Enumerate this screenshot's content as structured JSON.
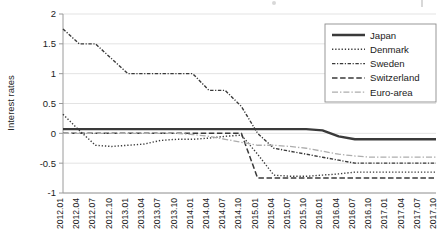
{
  "chart_data": {
    "type": "line",
    "title": "",
    "xlabel": "",
    "ylabel": "Interest rates",
    "ylim": [
      -1,
      2
    ],
    "yticks": [
      2,
      1.5,
      1,
      0.5,
      0,
      -0.5,
      -1
    ],
    "ytick_labels": [
      "2",
      "1.5",
      "1",
      "0.5",
      "0",
      "-0.5",
      "-1"
    ],
    "grid": true,
    "legend_position": "top-right",
    "categories": [
      "2012.01",
      "2012.04",
      "2012.07",
      "2012.10",
      "2013.01",
      "2013.04",
      "2013.07",
      "2013.10",
      "2014.01",
      "2014.04",
      "2014.07",
      "2014.10",
      "2015.01",
      "2015.04",
      "2015.07",
      "2015.10",
      "2016.01",
      "2016.04",
      "2016.07",
      "2016.10",
      "2017.01",
      "2017.04",
      "2017.07",
      "2017.10"
    ],
    "series": [
      {
        "name": "Japan",
        "style": "solid",
        "color": "#3a3a3a",
        "width": 2.4,
        "values": [
          0.07,
          0.07,
          0.07,
          0.07,
          0.07,
          0.07,
          0.07,
          0.07,
          0.07,
          0.07,
          0.07,
          0.07,
          0.07,
          0.07,
          0.07,
          0.07,
          0.05,
          -0.05,
          -0.1,
          -0.1,
          -0.1,
          -0.1,
          -0.1,
          -0.1
        ]
      },
      {
        "name": "Denmark",
        "style": "dotted",
        "color": "#3a3a3a",
        "width": 1.4,
        "values": [
          0.32,
          0.05,
          -0.2,
          -0.22,
          -0.2,
          -0.18,
          -0.12,
          -0.1,
          -0.1,
          -0.08,
          -0.05,
          -0.03,
          -0.35,
          -0.7,
          -0.72,
          -0.72,
          -0.7,
          -0.68,
          -0.65,
          -0.65,
          -0.65,
          -0.65,
          -0.65,
          -0.65
        ]
      },
      {
        "name": "Sweden",
        "style": "dashdot-fine",
        "color": "#3a3a3a",
        "width": 1.4,
        "values": [
          1.75,
          1.5,
          1.5,
          1.25,
          1.0,
          1.0,
          1.0,
          1.0,
          1.0,
          0.72,
          0.72,
          0.45,
          0.0,
          -0.25,
          -0.3,
          -0.35,
          -0.4,
          -0.45,
          -0.5,
          -0.5,
          -0.5,
          -0.5,
          -0.5,
          -0.5
        ]
      },
      {
        "name": "Switzerland",
        "style": "dashed",
        "color": "#3a3a3a",
        "width": 1.5,
        "values": [
          0.0,
          0.0,
          0.0,
          0.0,
          0.0,
          0.0,
          0.0,
          0.0,
          0.0,
          0.0,
          0.0,
          0.0,
          -0.75,
          -0.75,
          -0.75,
          -0.75,
          -0.75,
          -0.75,
          -0.75,
          -0.75,
          -0.75,
          -0.75,
          -0.75,
          -0.75
        ]
      },
      {
        "name": "Euro-area",
        "style": "dashdot",
        "color": "#adadad",
        "width": 1.3,
        "values": [
          0.0,
          0.0,
          0.0,
          0.0,
          0.0,
          0.0,
          0.0,
          0.0,
          -0.02,
          -0.05,
          -0.1,
          -0.15,
          -0.2,
          -0.2,
          -0.22,
          -0.25,
          -0.3,
          -0.35,
          -0.38,
          -0.4,
          -0.4,
          -0.4,
          -0.4,
          -0.4
        ]
      }
    ]
  },
  "legend": {
    "items": [
      {
        "label": "Japan"
      },
      {
        "label": "Denmark"
      },
      {
        "label": "Sweden"
      },
      {
        "label": "Switzerland"
      },
      {
        "label": "Euro-area"
      }
    ]
  }
}
